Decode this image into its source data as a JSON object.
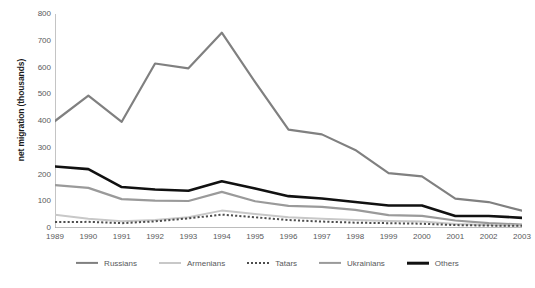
{
  "chart_data": {
    "type": "line",
    "title": "",
    "xlabel": "",
    "ylabel": "net migration (thousands)",
    "xlim": [
      1989,
      2003
    ],
    "ylim": [
      0,
      800
    ],
    "y_ticks": [
      800,
      700,
      600,
      500,
      400,
      300,
      200,
      100,
      0
    ],
    "grid": false,
    "legend_position": "bottom",
    "categories": [
      "1989",
      "1990",
      "1991",
      "1992",
      "1993",
      "1994",
      "1995",
      "1996",
      "1997",
      "1998",
      "1999",
      "2000",
      "2001",
      "2002",
      "2003"
    ],
    "series": [
      {
        "name": "Russians",
        "color": "#808080",
        "style": "solid",
        "width": 2.2,
        "values": [
          400,
          495,
          397,
          615,
          597,
          730,
          545,
          368,
          350,
          292,
          205,
          193,
          110,
          97,
          65
        ]
      },
      {
        "name": "Armenians",
        "color": "#c8c8c8",
        "style": "solid",
        "width": 2.0,
        "values": [
          50,
          35,
          25,
          30,
          40,
          65,
          52,
          40,
          35,
          30,
          26,
          24,
          15,
          11,
          9
        ]
      },
      {
        "name": "Tatars",
        "color": "#4d4d4d",
        "style": "dotted",
        "width": 2.0,
        "values": [
          22,
          23,
          18,
          25,
          36,
          50,
          40,
          30,
          24,
          20,
          18,
          16,
          11,
          9,
          8
        ]
      },
      {
        "name": "Ukrainians",
        "color": "#9a9a9a",
        "style": "solid",
        "width": 2.2,
        "values": [
          160,
          150,
          108,
          102,
          101,
          135,
          100,
          83,
          79,
          68,
          48,
          45,
          28,
          18,
          13
        ]
      },
      {
        "name": "Others",
        "color": "#111111",
        "style": "solid",
        "width": 2.6,
        "values": [
          230,
          220,
          153,
          144,
          139,
          175,
          148,
          119,
          110,
          97,
          84,
          84,
          45,
          45,
          38
        ]
      }
    ]
  },
  "axis": {
    "y_title": "net migration (thousands)"
  },
  "legend": {
    "items": [
      {
        "label": "Russians"
      },
      {
        "label": "Armenians"
      },
      {
        "label": "Tatars"
      },
      {
        "label": "Ukrainians"
      },
      {
        "label": "Others"
      }
    ]
  }
}
